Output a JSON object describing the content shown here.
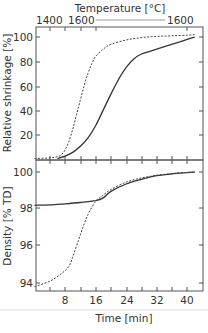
{
  "chart_data": [
    {
      "type": "line",
      "panel": "top",
      "title": "",
      "top_axis_label": "Temperature [°C]",
      "top_axis_ticks": [
        "1400",
        "1600",
        "1600"
      ],
      "ylabel": "Relative shrinkage [%]",
      "yticks": [
        "20",
        "40",
        "60",
        "80",
        "100"
      ],
      "ylim": [
        -2,
        108
      ],
      "xlim": [
        0,
        44
      ],
      "grid": false,
      "series": [
        {
          "name": "dashed",
          "style": "dashed",
          "x": [
            0,
            4,
            6,
            7,
            8,
            9,
            10,
            11,
            12,
            13,
            14,
            15,
            16,
            18,
            20,
            24,
            28,
            32,
            36,
            40,
            42
          ],
          "y": [
            0,
            0.5,
            1.5,
            3,
            7,
            14,
            24,
            36,
            48,
            60,
            70,
            78,
            84,
            90,
            94,
            97.5,
            99.5,
            100.5,
            101,
            101.5,
            102
          ]
        },
        {
          "name": "solid",
          "style": "solid",
          "x": [
            6,
            8,
            10,
            12,
            14,
            16,
            18,
            20,
            22,
            24,
            26,
            28,
            30,
            34,
            38,
            42
          ],
          "y": [
            0,
            2,
            5,
            10,
            17,
            27,
            40,
            53,
            65,
            75,
            82,
            86,
            88,
            92,
            96,
            100
          ]
        }
      ]
    },
    {
      "type": "line",
      "panel": "bottom",
      "title": "",
      "xlabel": "Time [min]",
      "xticks": [
        "8",
        "16",
        "24",
        "32",
        "40"
      ],
      "ylabel": "Density [% TD]",
      "yticks": [
        "94",
        "96",
        "98",
        "100"
      ],
      "ylim": [
        93.6,
        100.6
      ],
      "xlim": [
        0,
        44
      ],
      "grid": false,
      "series": [
        {
          "name": "solid",
          "style": "solid",
          "x": [
            0,
            4,
            8,
            12,
            16,
            18,
            20,
            24,
            28,
            32,
            36,
            40,
            42
          ],
          "y": [
            98.2,
            98.22,
            98.28,
            98.35,
            98.45,
            98.6,
            98.95,
            99.35,
            99.6,
            99.8,
            99.9,
            99.97,
            100
          ]
        },
        {
          "name": "dashed",
          "style": "dashed",
          "x": [
            0,
            4,
            7,
            9,
            10,
            11,
            12,
            13,
            14,
            15,
            16,
            17,
            18,
            20,
            24,
            28,
            32,
            36,
            40,
            42
          ],
          "y": [
            93.8,
            94.1,
            94.5,
            94.9,
            95.4,
            96.0,
            96.6,
            97.2,
            97.7,
            98.1,
            98.4,
            98.6,
            98.75,
            99.05,
            99.45,
            99.68,
            99.82,
            99.92,
            99.98,
            100
          ]
        }
      ]
    }
  ]
}
